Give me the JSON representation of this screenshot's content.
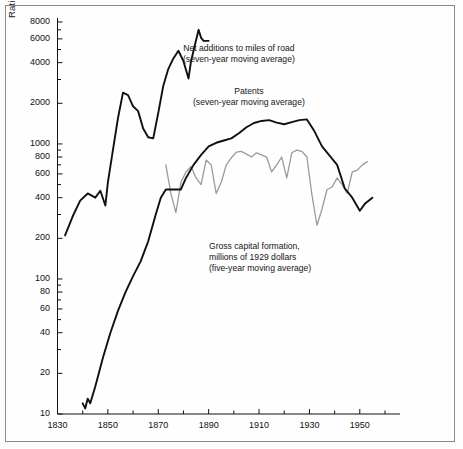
{
  "figure": {
    "axis_title_y": "Ratio Scale",
    "background": "#fefefe",
    "frame_color": "#8a8a8a"
  },
  "colors": {
    "road_line": "#101010",
    "patents_line": "#101010",
    "gcf_line": "#9a9a9a",
    "axis": "#111111",
    "text": "#151515"
  },
  "annotations": {
    "road": {
      "line1": "Net additions to miles of road",
      "line2": "(seven-year moving average)"
    },
    "patents": {
      "line1": "Patents",
      "line2": "(seven-year moving average)"
    },
    "gcf": {
      "line1": "Gross capital formation,",
      "line2": "millions of 1929 dollars",
      "line3": "(five-year moving average)"
    }
  },
  "chart_data": {
    "type": "line",
    "title": "",
    "xlabel": "",
    "ylabel": "Ratio Scale",
    "yscale": "log",
    "xlim": [
      1830,
      1960
    ],
    "ylim": [
      10,
      8000
    ],
    "grid": false,
    "legend": "annotations-inline",
    "ytick_labels": [
      "10",
      "20",
      "40",
      "60",
      "80",
      "100",
      "200",
      "400",
      "600",
      "800",
      "1000",
      "2000",
      "4000",
      "6000",
      "8000"
    ],
    "ytick_values": [
      10,
      20,
      40,
      60,
      80,
      100,
      200,
      400,
      600,
      800,
      1000,
      2000,
      4000,
      6000,
      8000
    ],
    "xtick_labels": [
      "1830",
      "1850",
      "1870",
      "1890",
      "1910",
      "1930",
      "1950"
    ],
    "xtick_values": [
      1830,
      1850,
      1870,
      1890,
      1910,
      1930,
      1950
    ],
    "xminor_values": [
      1840,
      1860,
      1880,
      1900,
      1920,
      1940,
      1960
    ],
    "series": [
      {
        "name": "Net additions to miles of road (seven-year moving average)",
        "color": "#101010",
        "width": 1.9,
        "x": [
          1833,
          1836,
          1839,
          1842,
          1845,
          1847,
          1849,
          1850,
          1852,
          1854,
          1856,
          1858,
          1860,
          1862,
          1864,
          1866,
          1868,
          1870,
          1872,
          1874,
          1876,
          1878,
          1880,
          1882,
          1883,
          1884,
          1886,
          1887,
          1888,
          1890
        ],
        "y": [
          210,
          290,
          380,
          430,
          400,
          450,
          350,
          520,
          900,
          1550,
          2400,
          2300,
          1900,
          1750,
          1300,
          1120,
          1100,
          1700,
          2700,
          3600,
          4300,
          4900,
          4100,
          3050,
          4100,
          4900,
          7000,
          6100,
          5800,
          5800
        ]
      },
      {
        "name": "Patents (seven-year moving average)",
        "color": "#101010",
        "width": 1.9,
        "x": [
          1840,
          1841,
          1842,
          1843,
          1845,
          1848,
          1851,
          1854,
          1857,
          1860,
          1863,
          1866,
          1869,
          1871,
          1873,
          1876,
          1879,
          1881,
          1884,
          1887,
          1890,
          1893,
          1896,
          1899,
          1902,
          1905,
          1908,
          1911,
          1914,
          1917,
          1920,
          1923,
          1926,
          1929,
          1932,
          1935,
          1938,
          1941,
          1944,
          1947,
          1950,
          1952,
          1955
        ],
        "y": [
          12,
          11,
          13,
          12,
          16,
          26,
          40,
          58,
          80,
          105,
          135,
          190,
          300,
          400,
          460,
          460,
          460,
          560,
          700,
          830,
          960,
          1020,
          1060,
          1100,
          1200,
          1330,
          1430,
          1480,
          1500,
          1440,
          1400,
          1450,
          1500,
          1520,
          1240,
          960,
          820,
          700,
          470,
          400,
          320,
          360,
          400
        ]
      },
      {
        "name": "Gross capital formation, millions of 1929 dollars (five-year moving average)",
        "color": "#9a9a9a",
        "width": 1.3,
        "x": [
          1873,
          1875,
          1877,
          1879,
          1881,
          1883,
          1885,
          1887,
          1889,
          1891,
          1893,
          1895,
          1897,
          1899,
          1901,
          1903,
          1905,
          1907,
          1909,
          1911,
          1913,
          1915,
          1917,
          1919,
          1921,
          1923,
          1925,
          1927,
          1929,
          1931,
          1933,
          1935,
          1937,
          1939,
          1941,
          1943,
          1945,
          1947,
          1949,
          1951,
          1953
        ],
        "y": [
          700,
          430,
          310,
          520,
          620,
          680,
          560,
          500,
          760,
          700,
          430,
          520,
          700,
          790,
          870,
          880,
          840,
          800,
          860,
          830,
          800,
          620,
          700,
          800,
          560,
          860,
          900,
          880,
          800,
          420,
          250,
          330,
          460,
          480,
          560,
          500,
          430,
          620,
          640,
          700,
          740
        ]
      }
    ]
  }
}
